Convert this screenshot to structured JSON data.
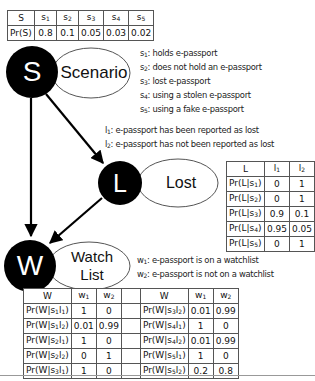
{
  "colors": {
    "node_fill": "#000000",
    "node_text": "#ffffff",
    "edge": "#000000",
    "ellipse_stroke": "#555555"
  },
  "nodes": {
    "scenario": {
      "symbol": "S",
      "label": "Scenario"
    },
    "lost": {
      "symbol": "L",
      "label": "Lost"
    },
    "watchlist": {
      "symbol": "W",
      "label_line1": "Watch",
      "label_line2": "List"
    }
  },
  "prior_table": {
    "headers": [
      "S",
      "s1",
      "s2",
      "s3",
      "s4",
      "s5"
    ],
    "row_label": "Pr(S)",
    "values": [
      "0.8",
      "0.1",
      "0.05",
      "0.03",
      "0.02"
    ]
  },
  "scenario_legend": [
    {
      "key": "s1",
      "text": ": holds e-passport"
    },
    {
      "key": "s2",
      "text": ": does not hold an e-passport"
    },
    {
      "key": "s3",
      "text": ": lost e-passport"
    },
    {
      "key": "s4",
      "text": ": using a stolen e-passport"
    },
    {
      "key": "s5",
      "text": ": using a fake e-passport"
    }
  ],
  "lost_legend": [
    {
      "key": "l1",
      "text": ": e-passport has been reported as lost"
    },
    {
      "key": "l2",
      "text": ": e-passport has not been reported as lost"
    }
  ],
  "watch_legend": [
    {
      "key": "w1",
      "text": ": e-passport is on a watchlist"
    },
    {
      "key": "w2",
      "text": ": e-passport is not on a watchlist"
    }
  ],
  "lost_table": {
    "headers": [
      "L",
      "l1",
      "l2"
    ],
    "rows": [
      {
        "label": "Pr(L|s1)",
        "v1": "0",
        "v2": "1"
      },
      {
        "label": "Pr(L|s2)",
        "v1": "0",
        "v2": "1"
      },
      {
        "label": "Pr(L|s3)",
        "v1": "0.9",
        "v2": "0.1"
      },
      {
        "label": "Pr(L|s4)",
        "v1": "0.95",
        "v2": "0.05"
      },
      {
        "label": "Pr(L|s5)",
        "v1": "0",
        "v2": "1"
      }
    ]
  },
  "watch_table": {
    "headers": [
      "W",
      "w1",
      "w2",
      "",
      "W",
      "w1",
      "w2"
    ],
    "rows": [
      {
        "l_label": "Pr(W|s1l1)",
        "l_v1": "1",
        "l_v2": "0",
        "r_label": "Pr(W|s3l2)",
        "r_v1": "0.01",
        "r_v2": "0.99"
      },
      {
        "l_label": "Pr(W|s1l2)",
        "l_v1": "0.01",
        "l_v2": "0.99",
        "r_label": "Pr(W|s4l1)",
        "r_v1": "1",
        "r_v2": "0"
      },
      {
        "l_label": "Pr(W|s2l1)",
        "l_v1": "1",
        "l_v2": "0",
        "r_label": "Pr(W|s4l2)",
        "r_v1": "0.01",
        "r_v2": "0.99"
      },
      {
        "l_label": "Pr(W|s2l2)",
        "l_v1": "0",
        "l_v2": "1",
        "r_label": "Pr(W|s5l1)",
        "r_v1": "1",
        "r_v2": "0"
      },
      {
        "l_label": "Pr(W|s3l1)",
        "l_v1": "1",
        "l_v2": "0",
        "r_label": "Pr(W|s5l2)",
        "r_v1": "0.2",
        "r_v2": "0.8"
      }
    ]
  }
}
